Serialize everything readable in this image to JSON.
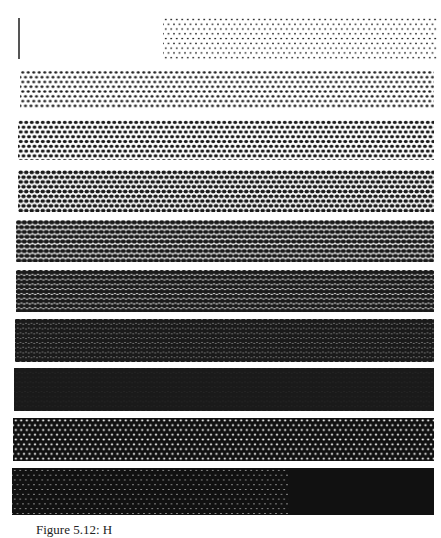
{
  "figure": {
    "caption": "Figure 5.12: H",
    "strips": [
      {
        "level": 1,
        "x": 163,
        "y": 17,
        "w": 274,
        "h": 43,
        "dot": 0.9,
        "pitch": 5.5
      },
      {
        "level": 2,
        "x": 20,
        "y": 70,
        "w": 414,
        "h": 38,
        "dot": 1.4,
        "pitch": 5.5
      },
      {
        "level": 3,
        "x": 18,
        "y": 120,
        "w": 416,
        "h": 40,
        "dot": 1.8,
        "pitch": 5.5
      },
      {
        "level": 4,
        "x": 18,
        "y": 170,
        "w": 416,
        "h": 42,
        "dot": 2.1,
        "pitch": 5.5
      },
      {
        "level": 5,
        "x": 16,
        "y": 220,
        "w": 418,
        "h": 42,
        "dot": 2.4,
        "pitch": 5.5
      },
      {
        "level": 6,
        "x": 16,
        "y": 270,
        "w": 418,
        "h": 42,
        "dot": 2.7,
        "pitch": 5.5
      },
      {
        "level": 7,
        "x": 15,
        "y": 319,
        "w": 419,
        "h": 43,
        "dot": 3.0,
        "pitch": 5.5
      },
      {
        "level": 8,
        "x": 14,
        "y": 368,
        "w": 420,
        "h": 43,
        "dot": 3.3,
        "pitch": 5.5
      },
      {
        "level": 9,
        "x": 13,
        "y": 418,
        "w": 421,
        "h": 43,
        "dot": -1.1,
        "pitch": 5.5
      },
      {
        "level": 10,
        "x": 12,
        "y": 468,
        "w": 422,
        "h": 47,
        "dot": -0.6,
        "pitch": 5.5
      }
    ]
  }
}
